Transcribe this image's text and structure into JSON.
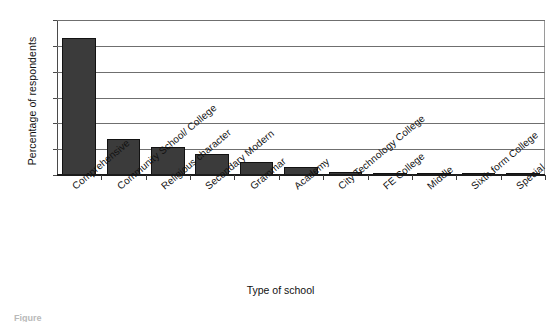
{
  "chart_data": {
    "type": "bar",
    "title": "",
    "xlabel": "Type of school",
    "ylabel": "Percentage of respondents",
    "ylim": [
      0,
      60
    ],
    "yticks": [
      0,
      10,
      20,
      30,
      40,
      50,
      60
    ],
    "grid": true,
    "legend": false,
    "bar_color": "#3b3b3b",
    "categories": [
      "Comprehensive",
      "Community School/ College",
      "Religious character",
      "Secondary Modern",
      "Grammar",
      "Academy",
      "City Technology College",
      "FE College",
      "Middle",
      "Sixth form College",
      "Special"
    ],
    "values": [
      53,
      14,
      11,
      8,
      5,
      3,
      1,
      0.5,
      0.3,
      0.3,
      0.3
    ]
  },
  "caption": {
    "text": "Figure"
  }
}
